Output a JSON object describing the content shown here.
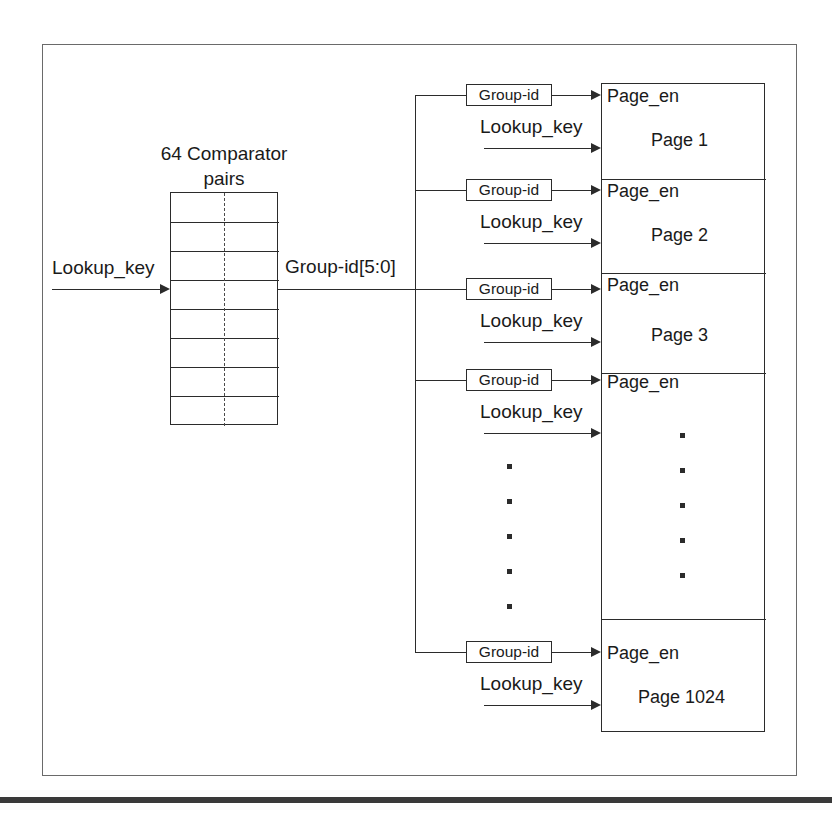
{
  "diagram": {
    "comparator": {
      "title_line1": "64 Comparator",
      "title_line2": "pairs",
      "rows": 8,
      "input_label": "Lookup_key",
      "output_label": "Group-id[5:0]"
    },
    "bus": {
      "signal": "Group-id[5:0]"
    },
    "branches": [
      {
        "group_id_label": "Group-id",
        "lookup_label": "Lookup_key"
      },
      {
        "group_id_label": "Group-id",
        "lookup_label": "Lookup_key"
      },
      {
        "group_id_label": "Group-id",
        "lookup_label": "Lookup_key"
      },
      {
        "group_id_label": "Group-id",
        "lookup_label": "Lookup_key"
      },
      {
        "group_id_label": "Group-id",
        "lookup_label": "Lookup_key"
      }
    ],
    "pages": [
      {
        "enable_label": "Page_en",
        "name": "Page 1"
      },
      {
        "enable_label": "Page_en",
        "name": "Page 2"
      },
      {
        "enable_label": "Page_en",
        "name": "Page 3"
      },
      {
        "enable_label": "Page_en",
        "name": ""
      },
      {
        "enable_label": "Page_en",
        "name": "Page 1024"
      }
    ],
    "ellipsis": {
      "bus_dots_count": 5,
      "page_dots_count": 5
    },
    "colors": {
      "line": "#2b2b2b",
      "frame": "#6a6a6a",
      "bar": "#3a3a3a",
      "background": "#ffffff"
    }
  }
}
